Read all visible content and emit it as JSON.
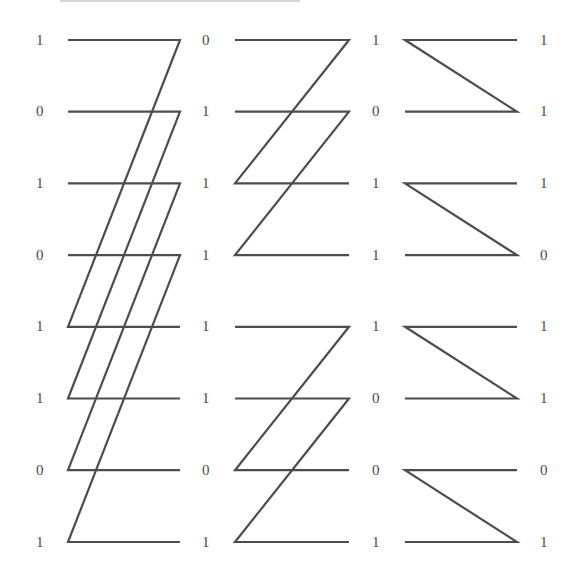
{
  "diagram": {
    "type": "butterfly-permutation-network",
    "stage_count": 3,
    "row_count": 8,
    "columns": [
      {
        "name": "column-0",
        "values": [
          "1",
          "0",
          "1",
          "0",
          "1",
          "1",
          "0",
          "1"
        ]
      },
      {
        "name": "column-1",
        "values": [
          "0",
          "1",
          "1",
          "1",
          "1",
          "1",
          "0",
          "1"
        ]
      },
      {
        "name": "column-2",
        "values": [
          "1",
          "0",
          "1",
          "1",
          "1",
          "0",
          "0",
          "1"
        ]
      },
      {
        "name": "column-3",
        "values": [
          "1",
          "1",
          "1",
          "0",
          "1",
          "1",
          "0",
          "1"
        ]
      }
    ],
    "stages": [
      {
        "name": "stage-1",
        "description": "each wire from row r (r=0..3) crosses to row r+4",
        "paired_offset": 4
      },
      {
        "name": "stage-2",
        "description": "each wire from row r crosses to row r+2 within groups of 4",
        "paired_offset": 2
      },
      {
        "name": "stage-3",
        "description": "each wire from row r crosses to row r+1 within pairs",
        "paired_offset": 1
      }
    ],
    "colors": {
      "line": "#4d4d4d",
      "text": "#4a4a4a",
      "background": "#ffffff"
    }
  }
}
